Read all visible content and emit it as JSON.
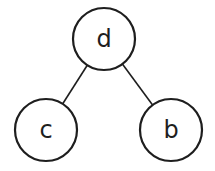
{
  "diagram": {
    "type": "tree",
    "background_color": "#ffffff",
    "stroke_color": "#1e1e1e",
    "node_fill_color": "#ffffff",
    "node_stroke_width": 2.2,
    "edge_stroke_width": 1.6,
    "label_font_size": 24,
    "nodes": [
      {
        "id": "d",
        "label": "d",
        "x": 104,
        "y": 39,
        "r": 31
      },
      {
        "id": "c",
        "label": "c",
        "x": 46,
        "y": 130,
        "r": 31
      },
      {
        "id": "b",
        "label": "b",
        "x": 171,
        "y": 130,
        "r": 31
      }
    ],
    "edges": [
      {
        "from": "d",
        "to": "c"
      },
      {
        "from": "d",
        "to": "b"
      }
    ]
  }
}
